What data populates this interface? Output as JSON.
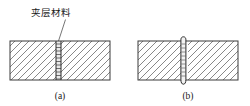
{
  "figure": {
    "background_color": "#ffffff",
    "line_color": "#3a3a3a",
    "hatch_color": "#555555",
    "band_fill_color": "#e9e9e9",
    "text_color": "#1a1a1a",
    "annotation": {
      "label": "夹层材料"
    },
    "panels": [
      {
        "id": "panel-a",
        "caption": "(a)",
        "joint_type": "interlayer-band",
        "plate": {
          "x": 10,
          "y": 41,
          "width": 100,
          "height": 39
        },
        "joint": {
          "x": 56,
          "width": 5
        }
      },
      {
        "id": "panel-b",
        "caption": "(b)",
        "joint_type": "weld-bead",
        "plate": {
          "x": 138,
          "y": 41,
          "width": 100,
          "height": 39
        },
        "joint": {
          "x": 183,
          "width": 5
        }
      }
    ]
  }
}
